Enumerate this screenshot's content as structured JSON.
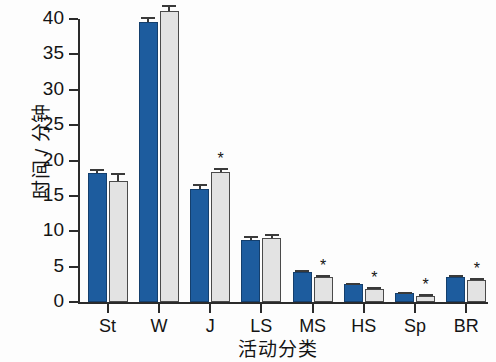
{
  "chart_data": {
    "type": "bar",
    "title": "",
    "xlabel": "活动分类",
    "ylabel": "时间 / 分钟",
    "categories": [
      "St",
      "W",
      "J",
      "LS",
      "MS",
      "HS",
      "Sp",
      "BR"
    ],
    "ylim": [
      0,
      40
    ],
    "yticks": [
      0,
      5,
      10,
      15,
      20,
      25,
      30,
      35,
      40
    ],
    "ytick_labels": [
      "0",
      "5",
      "10",
      "15",
      "20",
      "25",
      "30",
      "35",
      "40"
    ],
    "grid": false,
    "legend": "none",
    "series": [
      {
        "name": "series-a",
        "color": "#1d5c9e",
        "values": [
          18.3,
          39.6,
          16.0,
          8.8,
          4.2,
          2.5,
          1.3,
          3.5
        ],
        "errors": [
          0.5,
          0.7,
          0.7,
          0.5,
          0.3,
          0.2,
          0.15,
          0.25
        ],
        "significance": [
          "",
          "",
          "",
          "",
          "",
          "",
          "",
          ""
        ]
      },
      {
        "name": "series-b",
        "color": "#e3e3e3",
        "values": [
          17.1,
          41.2,
          18.4,
          9.0,
          3.5,
          1.9,
          0.9,
          3.1
        ],
        "errors": [
          1.1,
          0.8,
          0.6,
          0.6,
          0.35,
          0.25,
          0.2,
          0.3
        ],
        "significance": [
          "",
          "",
          "*",
          "",
          "*",
          "*",
          "*",
          "*"
        ]
      }
    ]
  }
}
